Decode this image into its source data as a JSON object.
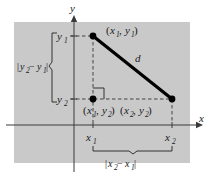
{
  "figure": {
    "canvas": {
      "width": 213,
      "height": 184
    },
    "panel": {
      "fill": "#c9c9c9",
      "x": 14,
      "y": 22,
      "width": 176,
      "height": 141
    },
    "axes": {
      "x_label": "x",
      "y_label": "y",
      "origin": {
        "x": 74,
        "y": 125
      },
      "color": "#3a3a3a"
    },
    "ticks": {
      "y1_label": "y",
      "y1_sub": "1",
      "y2_label": "y",
      "y2_sub": "2",
      "x1_label": "x",
      "x1_sub": "1",
      "x2_label": "x",
      "x2_sub": "2"
    },
    "points": [
      {
        "name": "upper-point",
        "label_open": "(",
        "label_x": "x",
        "label_x_sub": "1",
        "label_comma": ",",
        "label_y": "y",
        "label_y_sub": "1",
        "label_close": ")",
        "px": 93,
        "py": 36
      },
      {
        "name": "corner-point",
        "label_open": "(",
        "label_x": "x",
        "label_x_sub": "1",
        "label_comma": ",",
        "label_y": "y",
        "label_y_sub": "2",
        "label_close": ")",
        "px": 93,
        "py": 99
      },
      {
        "name": "lower-right-point",
        "label_open": "(",
        "label_x": "x",
        "label_x_sub": "2",
        "label_comma": ",",
        "label_y": "y",
        "label_y_sub": "2",
        "label_close": ")",
        "px": 172,
        "py": 99
      }
    ],
    "hypotenuse": {
      "label": "d",
      "color": "#000000",
      "from": {
        "x": 93,
        "y": 36
      },
      "to": {
        "x": 172,
        "y": 99
      }
    },
    "vertical_brace": {
      "bar": "|",
      "y": "y",
      "y_sub": "2",
      "minus": "−",
      "y2": "y",
      "y2_sub": "1",
      "bar_close": "|"
    },
    "horizontal_brace": {
      "bar": "|",
      "x": "x",
      "x_sub": "2",
      "minus": "−",
      "x2": "x",
      "x2_sub": "1",
      "bar_close": "|"
    }
  }
}
